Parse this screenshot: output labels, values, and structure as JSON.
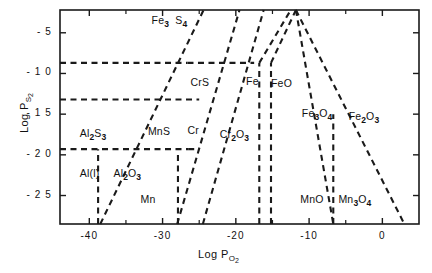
{
  "chart_data": {
    "type": "line",
    "title": "",
    "xlabel": "Log P O2",
    "ylabel": "Log P S2",
    "xlim": [
      -44,
      5
    ],
    "ylim": [
      -28.5,
      -2.2
    ],
    "grid": false,
    "legend": "none",
    "axis": {
      "x_title_main": "Log P",
      "x_title_sub_element": "O",
      "x_title_sub_index": "2",
      "y_title_main": "Log P",
      "y_title_sub_element": "S",
      "y_title_sub_index": "2",
      "x_ticks_major": [
        -40,
        -30,
        -20,
        -10,
        0
      ],
      "x_tick_labels": [
        "-40",
        "-30",
        "-20",
        "-10",
        "0"
      ],
      "x_ticks_minor": [
        -35,
        -25,
        -15,
        -5
      ],
      "y_ticks_major": [
        -5,
        -10,
        -15,
        -20,
        -25
      ],
      "y_tick_labels": [
        "- 5",
        "- 1 0",
        "- 1 5",
        "- 2 0",
        "- 2 5"
      ]
    },
    "regions": [
      {
        "name": "Fe3S4",
        "label_html": "Fe<sub>3</sub>&nbsp; S<sub>4</sub>",
        "x": -31.5,
        "y": -3.6
      },
      {
        "name": "CrS",
        "label_html": "CrS",
        "x": -26.2,
        "y": -11.2
      },
      {
        "name": "Fe",
        "label_html": "Fe",
        "x": -18.6,
        "y": -11.1
      },
      {
        "name": "FeO",
        "label_html": "FeO",
        "x": -15.2,
        "y": -11.3
      },
      {
        "name": "Fe3O4",
        "label_html": "Fe<sub>3</sub>O<sub>4</sub>",
        "x": -11.0,
        "y": -15.0
      },
      {
        "name": "Fe2O3",
        "label_html": "Fe<sub>2</sub>O<sub>3</sub>",
        "x": -4.6,
        "y": -15.3
      },
      {
        "name": "Al2S3",
        "label_html": "Al<sub>2</sub>S<sub>3</sub>",
        "x": -41.3,
        "y": -17.4
      },
      {
        "name": "MnS",
        "label_html": "MnS",
        "x": -32.0,
        "y": -17.2
      },
      {
        "name": "Cr",
        "label_html": "Cr",
        "x": -26.6,
        "y": -17.1
      },
      {
        "name": "Cr2O3",
        "label_html": "Cr<sub>2</sub>O<sub>3</sub>",
        "x": -22.2,
        "y": -17.6
      },
      {
        "name": "Al(l)",
        "label_html": "Al(l)",
        "x": -41.3,
        "y": -22.3
      },
      {
        "name": "Al2O3",
        "label_html": "Al<sub>2</sub>O<sub>3</sub>",
        "x": -36.7,
        "y": -22.4
      },
      {
        "name": "Mn",
        "label_html": "Mn",
        "x": -33.0,
        "y": -25.6
      },
      {
        "name": "MnO",
        "label_html": "MnO",
        "x": -11.2,
        "y": -25.5
      },
      {
        "name": "Mn3O4",
        "label_html": "Mn<sub>3</sub>O<sub>4</sub>",
        "x": -6.0,
        "y": -25.6
      }
    ],
    "boundaries": [
      {
        "name": "fe3s4-crs-horizontal",
        "points": [
          [
            -44,
            -8.7
          ],
          [
            -26.6,
            -8.7
          ]
        ]
      },
      {
        "name": "crs-fe-horizontal",
        "points": [
          [
            -26.6,
            -8.7
          ],
          [
            -17.5,
            -8.7
          ]
        ]
      },
      {
        "name": "crs-mns-horizontal",
        "points": [
          [
            -44,
            -13.2
          ],
          [
            -25.0,
            -13.2
          ]
        ]
      },
      {
        "name": "al2s3-mns-horizontal",
        "points": [
          [
            -44,
            -19.3
          ],
          [
            -26.5,
            -19.3
          ]
        ]
      },
      {
        "name": "mns-cr2o3-horizontal",
        "points": [
          [
            -26.5,
            -19.3
          ],
          [
            -25.0,
            -19.3
          ]
        ]
      },
      {
        "name": "mns-crs-diagonal",
        "points": [
          [
            -38.5,
            -28.5
          ],
          [
            -24.4,
            -2.2
          ]
        ]
      },
      {
        "name": "cr-fe-diagonal",
        "points": [
          [
            -28.0,
            -28.5
          ],
          [
            -19.5,
            -2.2
          ]
        ]
      },
      {
        "name": "cr2o3-fe-diagonal",
        "points": [
          [
            -24.5,
            -28.5
          ],
          [
            -16.2,
            -2.2
          ]
        ]
      },
      {
        "name": "fe-feo-vertical",
        "points": [
          [
            -16.8,
            -28.5
          ],
          [
            -16.8,
            -8.7
          ]
        ]
      },
      {
        "name": "feo-fe3o4-vertical",
        "points": [
          [
            -15.2,
            -28.5
          ],
          [
            -15.2,
            -8.7
          ]
        ]
      },
      {
        "name": "feo-upper-diagonal",
        "points": [
          [
            -16.8,
            -8.7
          ],
          [
            -12.5,
            -2.2
          ]
        ]
      },
      {
        "name": "fe3o4-upper-diagonal",
        "points": [
          [
            -15.2,
            -8.7
          ],
          [
            -11.8,
            -2.2
          ]
        ]
      },
      {
        "name": "fe3o4-peak-left",
        "points": [
          [
            -11.8,
            -2.2
          ],
          [
            -6.7,
            -28.5
          ]
        ]
      },
      {
        "name": "fe2o3-peak-right",
        "points": [
          [
            -11.8,
            -2.2
          ],
          [
            3.0,
            -28.5
          ]
        ]
      },
      {
        "name": "al2o3-al-vertical",
        "points": [
          [
            -38.8,
            -28.5
          ],
          [
            -38.8,
            -19.3
          ]
        ]
      },
      {
        "name": "mn-cr-vertical",
        "points": [
          [
            -27.9,
            -28.5
          ],
          [
            -27.9,
            -19.6
          ]
        ]
      },
      {
        "name": "mno-mn3o4-vertical",
        "points": [
          [
            -6.7,
            -28.5
          ],
          [
            -6.7,
            -15.0
          ]
        ]
      }
    ]
  }
}
